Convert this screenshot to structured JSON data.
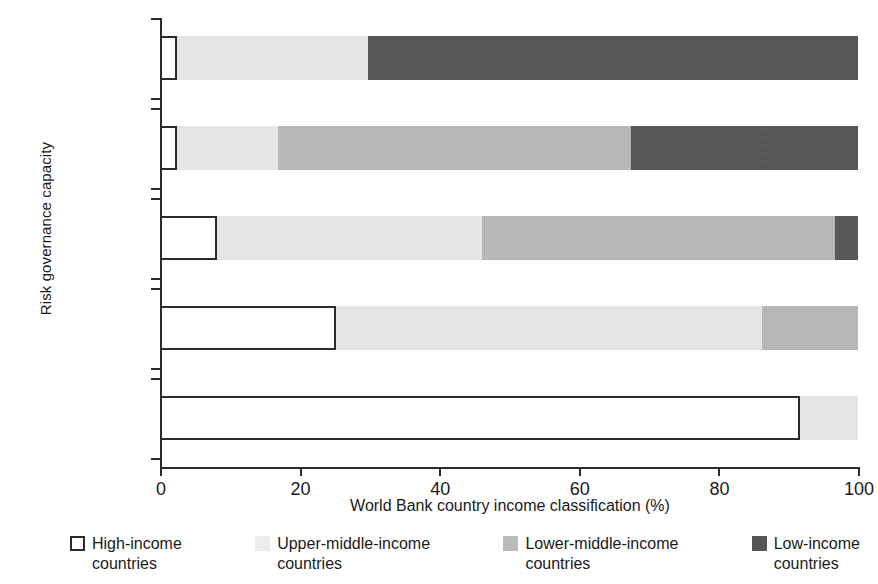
{
  "chart_data": {
    "type": "bar",
    "orientation": "horizontal",
    "stacked": true,
    "stack_mode": "percent",
    "title": "",
    "xlabel": "World Bank country income classification (%)",
    "ylabel": "Risk governance capacity",
    "xlim": [
      0,
      100
    ],
    "xticks": [
      0,
      20,
      40,
      60,
      80,
      100
    ],
    "xtick_labels": [
      "0",
      "20",
      "40",
      "60",
      "80",
      "100"
    ],
    "grid": false,
    "legend_position": "bottom",
    "categories": [
      "Low capacity",
      "Medium-low capacity",
      "Medium capacity",
      "Medium-high capacity",
      "High capacity"
    ],
    "category_lines": [
      [
        "Low",
        "capacity"
      ],
      [
        "Medium-low",
        "capacity"
      ],
      [
        "Medium",
        "capacity"
      ],
      [
        "Medium-high",
        "capacity"
      ],
      [
        "High",
        "capacity"
      ]
    ],
    "series": [
      {
        "name": "High-income countries",
        "color": "#ffffff",
        "values": [
          2.5,
          2.5,
          8.2,
          25.2,
          91.7
        ]
      },
      {
        "name": "Upper-middle-income countries",
        "color": "#ececec",
        "values": [
          27.3,
          14.4,
          37.9,
          61.0,
          8.3
        ]
      },
      {
        "name": "Lower-middle-income countries",
        "color": "#bbbbbb",
        "values": [
          0.0,
          50.6,
          50.6,
          13.8,
          0.0
        ]
      },
      {
        "name": "Low-income countries",
        "color": "#555555",
        "values": [
          70.2,
          32.5,
          3.3,
          0.0,
          0.0
        ]
      }
    ]
  },
  "legend": {
    "items": [
      {
        "label": "High-income\ncountries",
        "swatch": "high-income-swatch",
        "color": "#ffffff"
      },
      {
        "label": "Upper-middle-income\ncountries",
        "swatch": "upper-middle-income-swatch",
        "color": "#ececec"
      },
      {
        "label": "Lower-middle-income\ncountries",
        "swatch": "lower-middle-income-swatch",
        "color": "#bbbbbb"
      },
      {
        "label": "Low-income\ncountries",
        "swatch": "low-income-swatch",
        "color": "#555555"
      }
    ]
  },
  "axes": {
    "y_title": "Risk governance capacity",
    "x_title": "World Bank country income classification (%)",
    "x_tick_labels": [
      "0",
      "20",
      "40",
      "60",
      "80",
      "100"
    ],
    "y_category_labels_line1": [
      "Low",
      "Medium-low",
      "Medium",
      "Medium-high",
      "High"
    ],
    "y_category_labels_line2": [
      "capacity",
      "capacity",
      "capacity",
      "capacity",
      "capacity"
    ]
  }
}
